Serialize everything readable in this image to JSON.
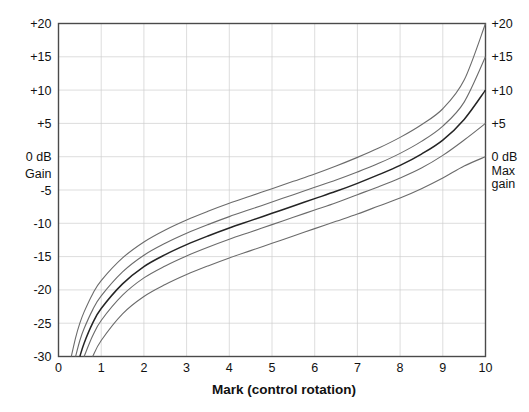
{
  "chart_data": {
    "type": "line",
    "title": "",
    "subtitle": "",
    "xlabel": "Mark  (control rotation)",
    "ylabel": "Gain",
    "ylabel_unit": "0 dB",
    "right_axis_label_line1": "Max",
    "right_axis_label_line2": "gain",
    "xlim": [
      0,
      10
    ],
    "ylim": [
      -30,
      20
    ],
    "grid": true,
    "legend": "none",
    "x_ticks": [
      "0",
      "1",
      "2",
      "3",
      "4",
      "5",
      "6",
      "7",
      "8",
      "9",
      "10"
    ],
    "x_tick_values": [
      0,
      1,
      2,
      3,
      4,
      5,
      6,
      7,
      8,
      9,
      10
    ],
    "y_ticks": [
      "+20",
      "+15",
      "+10",
      "+5",
      "0 dB",
      "-5",
      "-10",
      "-15",
      "-20",
      "-25",
      "-30"
    ],
    "y_tick_values": [
      20,
      15,
      10,
      5,
      0,
      -5,
      -10,
      -15,
      -20,
      -25,
      -30
    ],
    "y_ticks_right": [
      "+20",
      "+15",
      "+10",
      "+5",
      "0 dB"
    ],
    "y_tick_values_right": [
      20,
      15,
      10,
      5,
      0
    ],
    "x": [
      0,
      0.3,
      0.4,
      0.5,
      0.6,
      0.8,
      1,
      1.5,
      2,
      2.5,
      3,
      3.5,
      4,
      4.5,
      5,
      5.5,
      6,
      6.5,
      7,
      7.5,
      8,
      8.5,
      9,
      9.5,
      10
    ],
    "series": [
      {
        "name": "Max gain +20 dB",
        "max_gain": 20,
        "emphasis": false,
        "values": [
          null,
          -30.0,
          -27.2,
          -25.0,
          -23.3,
          -20.6,
          -18.6,
          -15.2,
          -12.8,
          -11.0,
          -9.5,
          -8.2,
          -7.0,
          -5.9,
          -4.8,
          -3.7,
          -2.6,
          -1.4,
          -0.1,
          1.3,
          2.9,
          4.8,
          7.2,
          11.5,
          20.0
        ]
      },
      {
        "name": "Max gain +15 dB",
        "max_gain": 15,
        "emphasis": false,
        "values": [
          null,
          null,
          -30.0,
          -27.6,
          -25.8,
          -23.0,
          -20.9,
          -17.3,
          -14.8,
          -13.0,
          -11.5,
          -10.2,
          -9.0,
          -7.9,
          -6.8,
          -5.7,
          -4.6,
          -3.5,
          -2.3,
          -1.0,
          0.5,
          2.3,
          4.6,
          8.2,
          15.0
        ]
      },
      {
        "name": "Max gain +10 dB",
        "max_gain": 10,
        "emphasis": true,
        "values": [
          null,
          null,
          null,
          -30.0,
          -28.0,
          -25.0,
          -22.8,
          -19.1,
          -16.5,
          -14.7,
          -13.2,
          -11.9,
          -10.7,
          -9.6,
          -8.5,
          -7.4,
          -6.3,
          -5.2,
          -4.0,
          -2.7,
          -1.3,
          0.4,
          2.5,
          5.6,
          10.0
        ]
      },
      {
        "name": "Max gain +5 dB",
        "max_gain": 5,
        "emphasis": false,
        "values": [
          null,
          null,
          null,
          null,
          -30.0,
          -26.9,
          -24.6,
          -20.8,
          -18.2,
          -16.4,
          -14.9,
          -13.6,
          -12.4,
          -11.3,
          -10.2,
          -9.1,
          -8.0,
          -6.9,
          -5.7,
          -4.5,
          -3.2,
          -1.7,
          0.2,
          2.5,
          5.0
        ]
      },
      {
        "name": "Max gain 0 dB",
        "max_gain": 0,
        "emphasis": false,
        "values": [
          null,
          null,
          null,
          null,
          null,
          -30.0,
          -27.6,
          -23.6,
          -21.0,
          -19.2,
          -17.7,
          -16.4,
          -15.2,
          -14.1,
          -13.0,
          -11.9,
          -10.8,
          -9.7,
          -8.6,
          -7.4,
          -6.2,
          -4.8,
          -3.2,
          -1.4,
          0.0
        ]
      }
    ]
  }
}
